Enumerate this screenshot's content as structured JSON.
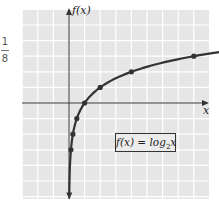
{
  "margin_note": {
    "numerator": "1",
    "denominator": "8"
  },
  "chart_data": {
    "type": "line",
    "title": "",
    "xlabel": "x",
    "ylabel": "f(x)",
    "legend_label": "f(x) = log2x",
    "function": "log2(x)",
    "grid": true,
    "x_range_units": [
      -3,
      9
    ],
    "y_range_units": [
      -6,
      6
    ],
    "points": [
      {
        "x": 0.125,
        "y": -3
      },
      {
        "x": 0.25,
        "y": -2
      },
      {
        "x": 0.5,
        "y": -1
      },
      {
        "x": 1,
        "y": 0
      },
      {
        "x": 2,
        "y": 1
      },
      {
        "x": 4,
        "y": 2
      },
      {
        "x": 8,
        "y": 3
      }
    ],
    "colors": {
      "curve": "#333333",
      "grid_bg": "#e6e6e6",
      "grid_line": "#ffffff",
      "axis": "#333333"
    }
  },
  "labels": {
    "y_axis": "f(x)",
    "x_axis": "x",
    "func_prefix": "f(x) = log",
    "func_sub": "2",
    "func_suffix": "x"
  }
}
